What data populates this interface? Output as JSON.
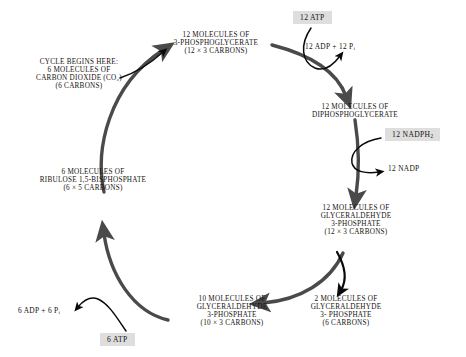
{
  "diagram": {
    "type": "cycle-flow-diagram",
    "background_color": "#ffffff",
    "cycle_arrow_color": "#4a4a4a",
    "cofactor_arrow_color": "#000000",
    "box_fill_color": "#dedede",
    "text_color": "#15120f"
  },
  "nodes": {
    "co2": {
      "name": "carbon-dioxide-entry",
      "lines": [
        "CYCLE BEGINS HERE:",
        "6 MOLECULES  OF",
        "CARBON DIOXIDE (CO₂)",
        "(6 CARBONS)"
      ]
    },
    "pga": {
      "name": "3-phosphoglycerate",
      "lines": [
        "12 MOLECULES OF",
        "3-PHOSPHOGLYCERATE",
        "(12 × 3 CARBONS)"
      ]
    },
    "dpga": {
      "name": "diphosphoglycerate",
      "lines": [
        "12 MOLECULES OF",
        "DIPHOSPHOGLYCERATE"
      ]
    },
    "g3p12": {
      "name": "glyceraldehyde-3-phosphate-12",
      "lines": [
        "12 MOLECULES OF",
        "GLYCERALDEHYDE",
        "3-PHOSPHATE",
        "(12 × 3 CARBONS)"
      ]
    },
    "g3p2": {
      "name": "glyceraldehyde-3-phosphate-2",
      "lines": [
        "2 MOLECULES OF",
        "GLYCERALDEHYDE",
        "3- PHOSPHATE",
        "(6 CARBONS)"
      ]
    },
    "g3p10": {
      "name": "glyceraldehyde-3-phosphate-10",
      "lines": [
        "10 MOLECULES OF",
        "GLYCERALDEHYDE",
        "3-PHOSPHATE",
        "(10 × 3 CARBONS)"
      ]
    },
    "rubp": {
      "name": "ribulose-1-5-bisphosphate",
      "lines": [
        "6 MOLECULES OF",
        "RIBULOSE 1,5-BISPHOSPHATE",
        "(6 × 5 CARBONS)"
      ]
    }
  },
  "cofactors": {
    "atp_12": {
      "label": "12 ATP",
      "boxed": true
    },
    "adp_12": {
      "label_html": "12  ADP  +  12  P<sub>i</sub>",
      "boxed": false
    },
    "nadph_12": {
      "label_html": "12 NADPH<sub>2</sub>",
      "boxed": true
    },
    "nadp_12": {
      "label": "12 NADP",
      "boxed": false
    },
    "atp_6": {
      "label": "6 ATP",
      "boxed": true
    },
    "adp_6": {
      "label_html": "6 ADP + 6 P<sub>i</sub>",
      "boxed": false
    }
  },
  "chart_data": {
    "type": "diagram",
    "steps": [
      {
        "from": "6 CO2 (6 carbons)",
        "to": "12 3-phosphoglycerate (12 x 3 carbons)",
        "consumes": [],
        "produces": []
      },
      {
        "from": "12 3-phosphoglycerate",
        "to": "12 diphosphoglycerate",
        "consumes": [
          "12 ATP"
        ],
        "produces": [
          "12 ADP",
          "12 Pi"
        ]
      },
      {
        "from": "12 diphosphoglycerate",
        "to": "12 glyceraldehyde 3-phosphate (12 x 3 carbons)",
        "consumes": [
          "12 NADPH2"
        ],
        "produces": [
          "12 NADP"
        ]
      },
      {
        "from": "12 glyceraldehyde 3-phosphate",
        "to": "2 glyceraldehyde 3-phosphate (6 carbons)",
        "consumes": [],
        "produces": []
      },
      {
        "from": "12 glyceraldehyde 3-phosphate",
        "to": "10 glyceraldehyde 3-phosphate (10 x 3 carbons)",
        "consumes": [],
        "produces": []
      },
      {
        "from": "10 glyceraldehyde 3-phosphate",
        "to": "6 ribulose 1,5-bisphosphate (6 x 5 carbons)",
        "consumes": [
          "6 ATP"
        ],
        "produces": [
          "6 ADP",
          "6 Pi"
        ]
      },
      {
        "from": "6 ribulose 1,5-bisphosphate",
        "to": "12 3-phosphoglycerate",
        "consumes": [
          "6 CO2"
        ],
        "produces": []
      }
    ]
  }
}
